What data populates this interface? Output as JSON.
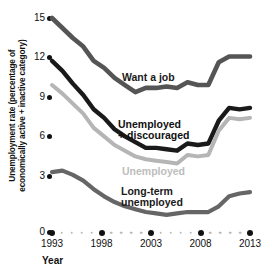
{
  "chart_data": {
    "type": "line",
    "title": "",
    "xlabel": "Year",
    "ylabel": "Unemployment rate (percentage of economically active + inactive category)",
    "ylabel_line1": "Unemployment rate (percentage of",
    "ylabel_line2": "economically active + inactive category)",
    "xlim": [
      1993,
      2012
    ],
    "ylim": [
      0,
      15
    ],
    "y_ticks": [
      15,
      12,
      9,
      6,
      3,
      0
    ],
    "x_ticks": [
      1993,
      1998,
      2003,
      2008,
      2013
    ],
    "x_tick_major": [
      1993,
      1998,
      2003,
      2008,
      2013
    ],
    "x_tick_minor": [
      1994,
      1995,
      1996,
      1997,
      1999,
      2000,
      2001,
      2002,
      2004,
      2005,
      2006,
      2007,
      2009,
      2010,
      2011,
      2012
    ],
    "grid": false,
    "legend_position": "inline-annotations",
    "x": [
      1993,
      1994,
      1995,
      1996,
      1997,
      1998,
      1999,
      2000,
      2001,
      2002,
      2003,
      2004,
      2005,
      2006,
      2007,
      2008,
      2009,
      2010,
      2011,
      2012
    ],
    "series": [
      {
        "name": "Want a job",
        "color": "#555555",
        "values": [
          15.0,
          14.3,
          13.6,
          13.0,
          12.0,
          11.5,
          10.8,
          10.3,
          9.8,
          10.1,
          10.1,
          10.2,
          10.1,
          10.5,
          10.3,
          10.3,
          11.9,
          12.3,
          12.3,
          12.3
        ]
      },
      {
        "name": "Unemployed + discouraged",
        "color": "#1a1a1a",
        "values": [
          12.0,
          11.3,
          10.4,
          9.6,
          8.6,
          8.0,
          7.2,
          6.7,
          6.3,
          5.9,
          5.9,
          5.8,
          5.7,
          6.2,
          6.1,
          6.2,
          7.8,
          8.7,
          8.6,
          8.7
        ]
      },
      {
        "name": "Unemployed",
        "color": "#b5b5b5",
        "values": [
          10.3,
          9.7,
          9.0,
          8.3,
          7.3,
          6.7,
          6.1,
          5.7,
          5.3,
          5.1,
          5.0,
          4.9,
          4.8,
          5.4,
          5.3,
          5.4,
          7.1,
          8.0,
          7.9,
          8.0
        ]
      },
      {
        "name": "Long-term unemployed",
        "color": "#666666",
        "values": [
          4.2,
          4.3,
          4.0,
          3.6,
          3.0,
          2.5,
          2.1,
          1.8,
          1.6,
          1.4,
          1.3,
          1.2,
          1.3,
          1.4,
          1.4,
          1.4,
          1.8,
          2.5,
          2.7,
          2.8
        ]
      }
    ],
    "annotations": [
      {
        "text": "Want a job",
        "lines": [
          "Want a job"
        ]
      },
      {
        "text": "Unemployed + discouraged",
        "lines": [
          "Unemployed",
          "+ discouraged"
        ]
      },
      {
        "text": "Unemployed",
        "lines": [
          "Unemployed"
        ]
      },
      {
        "text": "Long-term unemployed",
        "lines": [
          "Long-term",
          "unemployed"
        ]
      }
    ]
  },
  "axis": {
    "y_title_line1": "Unemployment rate (percentage of",
    "y_title_line2": "economically active + inactive category)",
    "x_title": "Year",
    "y_tick_labels": [
      "15",
      "12",
      "9",
      "6",
      "3",
      "0"
    ],
    "x_tick_labels": [
      "1993",
      "1998",
      "2003",
      "2008",
      "2013"
    ]
  },
  "labels": {
    "want_a_job": "Want a job",
    "unemployed_discouraged_l1": "Unemployed",
    "unemployed_discouraged_l2": "+ discouraged",
    "unemployed": "Unemployed",
    "longterm_l1": "Long-term",
    "longterm_l2": "unemployed"
  }
}
